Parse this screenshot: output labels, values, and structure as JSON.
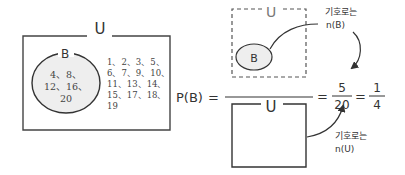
{
  "left_venn": {
    "universe_label": "U",
    "set_label": "B",
    "set_elements_lines": [
      "4、8、",
      "12、16、",
      "20"
    ],
    "outside_elements_lines": [
      "1、2、3、5、",
      "6、7、9、10、",
      "11、13、14、",
      "15、17、18、",
      "19"
    ]
  },
  "formula": {
    "lhs": "P(B)",
    "equals": "=",
    "numerator_box": {
      "universe_label": "U",
      "set_label": "B",
      "style": "dashed"
    },
    "denominator_box": {
      "universe_label": "U",
      "style": "solid"
    },
    "fraction1": {
      "numerator": "5",
      "denominator": "20"
    },
    "fraction2": {
      "numerator": "1",
      "denominator": "4"
    }
  },
  "annotations": {
    "numerator_note": {
      "line1": "기호로는",
      "line2": "n(B)"
    },
    "denominator_note": {
      "line1": "기호로는",
      "line2": "n(U)"
    }
  },
  "colors": {
    "stroke": "#333333",
    "set_fill": "#eeeeee",
    "text": "#333333"
  }
}
